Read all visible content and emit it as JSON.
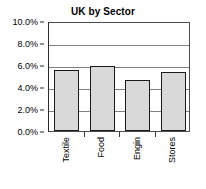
{
  "chart_data": {
    "type": "bar",
    "title": "UK by Sector",
    "xlabel": "",
    "ylabel": "",
    "categories": [
      "Textile",
      "Food",
      "Engin",
      "Stores"
    ],
    "values": [
      5.5,
      5.95,
      4.6,
      5.4
    ],
    "value_unit": "%",
    "ylim": [
      0.0,
      10.0
    ],
    "ytick_step": 2.0,
    "ytick_labels": [
      "0.0%",
      "2.0%",
      "4.0%",
      "6.0%",
      "8.0%",
      "10.0%"
    ],
    "ytick_values": [
      0.0,
      2.0,
      4.0,
      6.0,
      8.0,
      10.0
    ],
    "grid": true,
    "grid_axis": "y",
    "legend": false,
    "legend_position": "none",
    "xtick_rotation": 90,
    "series": [
      {
        "name": "UK by Sector",
        "values": [
          5.5,
          5.95,
          4.6,
          5.4
        ]
      }
    ],
    "colors": {
      "bar_fill": "#d9d9d9",
      "bar_outline": "#1a1a1a",
      "gridline": "#808080",
      "axis": "#2b2b2b",
      "text": "#000000",
      "background": "#ffffff"
    }
  }
}
